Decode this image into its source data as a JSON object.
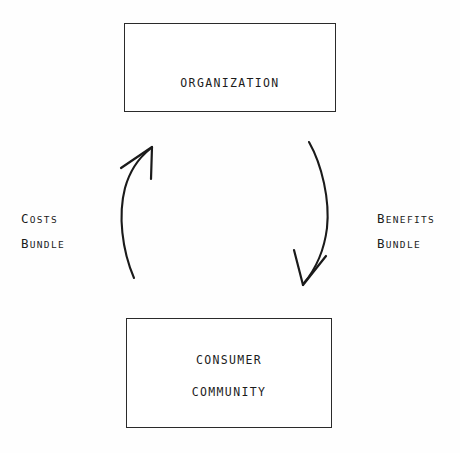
{
  "diagram": {
    "background_color": "#fefefe",
    "ink_color": "#1a1a1a",
    "nodes": [
      {
        "id": "organization",
        "lines": [
          "ORGANIZATION"
        ]
      },
      {
        "id": "consumer-community",
        "lines": [
          "CONSUMER",
          "COMMUNITY"
        ]
      }
    ],
    "edges": [
      {
        "id": "costs-bundle",
        "direction": "up",
        "from": "consumer-community",
        "to": "organization",
        "label_lines": [
          "Costs",
          "Bundle"
        ],
        "label_side": "left"
      },
      {
        "id": "benefits-bundle",
        "direction": "down",
        "from": "organization",
        "to": "consumer-community",
        "label_lines": [
          "Benefits",
          "Bundle"
        ],
        "label_side": "right"
      }
    ]
  },
  "nodes": {
    "organization": {
      "label": "ORGANIZATION"
    },
    "community": {
      "line1": "CONSUMER",
      "line2": "COMMUNITY"
    }
  },
  "labels": {
    "costs": {
      "word1_cap": "C",
      "word1_rest": "OSTS",
      "word2_cap": "B",
      "word2_rest": "UNDLE",
      "full": "Costs Bundle"
    },
    "benefits": {
      "word1_cap": "B",
      "word1_rest": "ENEFITS",
      "word2_cap": "B",
      "word2_rest": "UNDLE",
      "full": "Benefits Bundle"
    }
  }
}
